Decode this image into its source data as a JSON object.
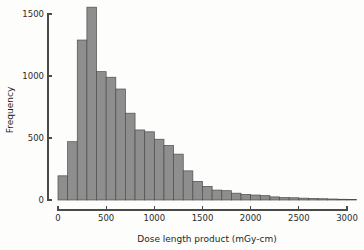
{
  "chart_data": {
    "type": "bar",
    "title": "",
    "subtitle": "",
    "xlabel": "Dose length product (mGy-cm)",
    "ylabel": "Frequency",
    "grid": false,
    "legend": null,
    "bin_width": 100,
    "xlim": [
      0,
      3100
    ],
    "ylim": [
      0,
      1600
    ],
    "xticks": [
      0,
      500,
      1000,
      1500,
      2000,
      2500,
      3000
    ],
    "xtick_labels": [
      "0",
      "500",
      "1000",
      "1500",
      "2000",
      "2500",
      "3000"
    ],
    "yticks": [
      0,
      500,
      1000,
      1500
    ],
    "ytick_labels": [
      "0",
      "500",
      "1000",
      "1500"
    ],
    "bin_starts": [
      0,
      100,
      200,
      300,
      400,
      500,
      600,
      700,
      800,
      900,
      1000,
      1100,
      1200,
      1300,
      1400,
      1500,
      1600,
      1700,
      1800,
      1900,
      2000,
      2100,
      2200,
      2300,
      2400,
      2500,
      2600,
      2700,
      2800,
      2900,
      3000
    ],
    "values": [
      195,
      470,
      1290,
      1555,
      1035,
      990,
      895,
      700,
      565,
      550,
      490,
      440,
      370,
      235,
      150,
      110,
      80,
      75,
      55,
      45,
      40,
      35,
      25,
      20,
      18,
      15,
      12,
      10,
      8,
      6,
      5
    ],
    "bar_fill_color": "#8e8e8e",
    "bar_edge_color": "#4d4d4d",
    "axis_color": "#4a4a4a",
    "background_color": "#fdfdfc"
  },
  "axes": {
    "x_title": "Dose length product (mGy-cm)",
    "y_title": "Frequency"
  }
}
